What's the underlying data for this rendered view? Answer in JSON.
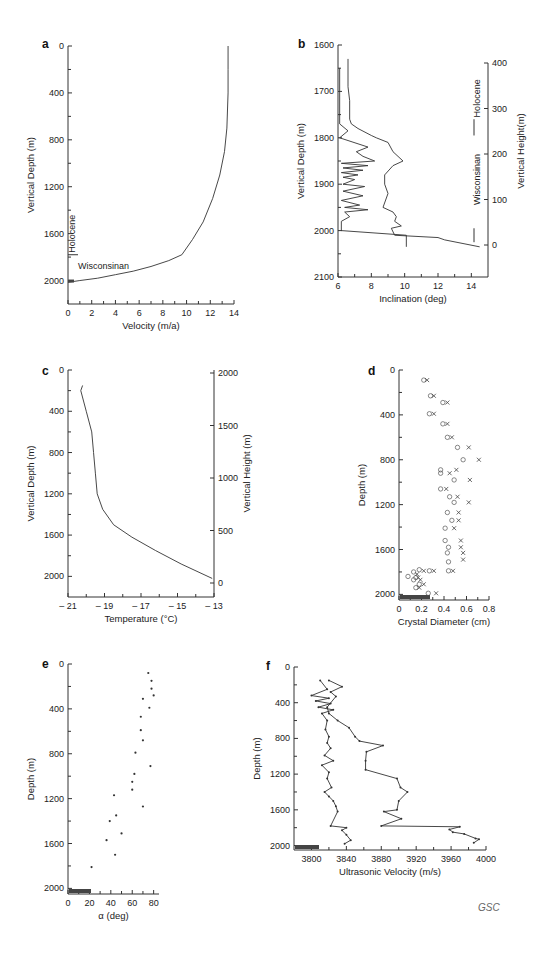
{
  "credit": "GSC",
  "chart_data": [
    {
      "panel": "a",
      "type": "line",
      "xlabel": "Velocity  (m/a)",
      "ylabel": "Vertical Depth (m)",
      "xlim": [
        0,
        14
      ],
      "ylim": [
        0,
        2200
      ],
      "y_inverted": true,
      "xticks": [
        0,
        2,
        4,
        6,
        8,
        10,
        12,
        14
      ],
      "yticks": [
        0,
        400,
        800,
        1200,
        1600,
        2000
      ],
      "annotations": [
        "Holocene",
        "Wisconsinan"
      ],
      "series": [
        {
          "name": "velocity",
          "x": [
            13.5,
            13.5,
            13.5,
            13.4,
            13.2,
            12.8,
            12.2,
            11.4,
            10.5,
            9.6,
            8.5,
            7,
            5.5,
            4,
            2.5,
            1,
            0
          ],
          "y": [
            0,
            200,
            400,
            700,
            900,
            1100,
            1300,
            1500,
            1650,
            1780,
            1830,
            1880,
            1920,
            1950,
            1980,
            2000,
            2015
          ]
        }
      ]
    },
    {
      "panel": "b",
      "type": "line",
      "xlabel": "Inclination (deg)",
      "ylabel": "Vertical Depth (m)",
      "y2label": "Vertical Height(m)",
      "xlim": [
        6,
        15
      ],
      "ylim": [
        1600,
        2100
      ],
      "y_inverted": true,
      "xticks": [
        6,
        8,
        10,
        12,
        14
      ],
      "yticks": [
        1600,
        1700,
        1800,
        1900,
        2000,
        2100
      ],
      "y2ticks": [
        0,
        100,
        200,
        300,
        400
      ],
      "annotations": [
        "Holocene",
        "Wisconsinan"
      ],
      "series": [
        {
          "name": "inclination-1",
          "x": [
            6.6,
            6.6,
            6.7,
            6.7,
            6.8,
            7.2,
            8.0,
            8.3,
            9.0,
            9.3,
            9.6,
            9.9,
            9.3,
            8.8,
            8.8,
            9.0,
            8.7,
            9.3,
            9.5,
            9.4,
            9.8,
            9.2,
            9.4,
            12.0,
            12.4,
            14.5
          ],
          "y": [
            1630,
            1690,
            1720,
            1760,
            1770,
            1780,
            1795,
            1800,
            1810,
            1830,
            1840,
            1850,
            1860,
            1880,
            1900,
            1920,
            1950,
            1960,
            1970,
            1980,
            1990,
            1995,
            2010,
            2015,
            2020,
            2035
          ]
        },
        {
          "name": "inclination-2",
          "x": [
            6.1,
            6.1,
            6.6,
            6.1,
            7.8,
            7.1,
            7.5,
            8.2,
            6.2,
            7.8,
            6.3,
            7.5,
            6.2,
            7.2,
            6.3,
            7.0,
            6.3,
            7.6,
            6.3,
            7.5,
            6.2,
            7.3,
            6.4,
            7.8,
            6.4,
            6.7,
            6.2,
            6.2,
            10.1,
            10.1
          ],
          "y": [
            1650,
            1770,
            1785,
            1800,
            1820,
            1830,
            1840,
            1850,
            1855,
            1860,
            1865,
            1870,
            1875,
            1880,
            1885,
            1890,
            1900,
            1905,
            1915,
            1925,
            1935,
            1945,
            1950,
            1955,
            1960,
            1970,
            1980,
            2000,
            2010,
            2035
          ]
        }
      ]
    },
    {
      "panel": "c",
      "type": "line",
      "xlabel": "Temperature (°C)",
      "ylabel": "Vertical Depth (m)",
      "y2label": "Vertical Height (m)",
      "xlim": [
        -21,
        -13
      ],
      "ylim": [
        0,
        2200
      ],
      "y_inverted": true,
      "xticks": [
        -21,
        -19,
        -17,
        -15,
        -13
      ],
      "xtick_labels": [
        "– 21",
        "– 19",
        "– 17",
        "– 15",
        "– 13"
      ],
      "yticks": [
        0,
        400,
        800,
        1200,
        1600,
        2000
      ],
      "y2ticks": [
        0,
        500,
        1000,
        1500,
        2000
      ],
      "series": [
        {
          "name": "temperature",
          "x": [
            -20.2,
            -20.3,
            -20.0,
            -19.7,
            -19.6,
            -19.5,
            -19.4,
            -19.1,
            -18.5,
            -17.5,
            -16.2,
            -14.8,
            -13.1
          ],
          "y": [
            150,
            200,
            400,
            600,
            800,
            1000,
            1200,
            1350,
            1500,
            1620,
            1750,
            1880,
            2020
          ]
        }
      ]
    },
    {
      "panel": "d",
      "type": "scatter",
      "xlabel": "Crystal Diameter (cm)",
      "ylabel": "Depth (m)",
      "xlim": [
        0,
        0.8
      ],
      "ylim": [
        0,
        2050
      ],
      "y_inverted": true,
      "xticks": [
        0,
        0.2,
        0.4,
        0.6,
        0.8
      ],
      "yticks": [
        0,
        400,
        800,
        1200,
        1600,
        2000
      ],
      "series": [
        {
          "name": "circles",
          "marker": "o",
          "x": [
            0.22,
            0.28,
            0.39,
            0.27,
            0.39,
            0.43,
            0.52,
            0.57,
            0.37,
            0.37,
            0.49,
            0.37,
            0.45,
            0.49,
            0.43,
            0.47,
            0.41,
            0.41,
            0.44,
            0.43,
            0.44,
            0.44,
            0.18,
            0.27,
            0.13,
            0.08,
            0.15,
            0.13,
            0.18,
            0.15,
            0.26
          ],
          "y": [
            90,
            230,
            290,
            390,
            480,
            600,
            690,
            800,
            890,
            920,
            980,
            1060,
            1130,
            1180,
            1270,
            1340,
            1410,
            1520,
            1580,
            1630,
            1710,
            1790,
            1780,
            1790,
            1800,
            1840,
            1850,
            1870,
            1910,
            1940,
            1990
          ]
        },
        {
          "name": "crosses",
          "marker": "x",
          "x": [
            0.25,
            0.31,
            0.43,
            0.31,
            0.43,
            0.47,
            0.62,
            0.71,
            0.45,
            0.51,
            0.63,
            0.42,
            0.52,
            0.62,
            0.53,
            0.53,
            0.49,
            0.55,
            0.55,
            0.57,
            0.57,
            0.48,
            0.22,
            0.31,
            0.16,
            0.17,
            0.19,
            0.22,
            0.18,
            0.33
          ],
          "y": [
            90,
            230,
            290,
            390,
            480,
            600,
            690,
            800,
            920,
            890,
            980,
            1060,
            1130,
            1180,
            1270,
            1340,
            1410,
            1520,
            1580,
            1630,
            1690,
            1790,
            1790,
            1790,
            1820,
            1850,
            1870,
            1910,
            1940,
            1990
          ]
        }
      ]
    },
    {
      "panel": "e",
      "type": "scatter",
      "xlabel": "α (deg)",
      "ylabel": "Depth (m)",
      "xlim": [
        0,
        85
      ],
      "ylim": [
        0,
        2050
      ],
      "y_inverted": true,
      "xticks": [
        0,
        20,
        40,
        60,
        80
      ],
      "yticks": [
        0,
        400,
        800,
        1200,
        1600,
        2000
      ],
      "series": [
        {
          "name": "alpha",
          "x": [
            75,
            78,
            78,
            80,
            70,
            76,
            68,
            68,
            70,
            63,
            77,
            62,
            60,
            60,
            43,
            70,
            45,
            39,
            50,
            36,
            44,
            22
          ],
          "y": [
            80,
            150,
            220,
            280,
            310,
            390,
            470,
            590,
            680,
            790,
            910,
            980,
            1050,
            1120,
            1170,
            1270,
            1350,
            1400,
            1510,
            1570,
            1700,
            1810
          ]
        }
      ]
    },
    {
      "panel": "f",
      "type": "line",
      "xlabel": "Ultrasonic Velocity (m/s)",
      "ylabel": "Depth (m)",
      "xlim": [
        3780,
        4000
      ],
      "ylim": [
        0,
        2050
      ],
      "y_inverted": true,
      "xticks": [
        3800,
        3840,
        3880,
        3920,
        3960,
        4000
      ],
      "yticks": [
        0,
        400,
        800,
        1200,
        1600,
        2000
      ],
      "series": [
        {
          "name": "velocity-1",
          "x": [
            3810,
            3818,
            3800,
            3820,
            3805,
            3822,
            3808,
            3825,
            3812,
            3818,
            3816,
            3820,
            3818,
            3822,
            3815,
            3825,
            3812,
            3820,
            3818,
            3823,
            3815,
            3820,
            3825,
            3828,
            3830,
            3822,
            3840,
            3835,
            3840,
            3845,
            3838
          ],
          "y": [
            150,
            250,
            320,
            350,
            380,
            410,
            450,
            480,
            520,
            600,
            700,
            780,
            850,
            910,
            990,
            1050,
            1100,
            1180,
            1250,
            1350,
            1400,
            1450,
            1500,
            1560,
            1620,
            1780,
            1800,
            1830,
            1880,
            1940,
            1980
          ]
        },
        {
          "name": "velocity-2",
          "x": [
            3820,
            3835,
            3822,
            3828,
            3818,
            3820,
            3830,
            3843,
            3850,
            3855,
            3882,
            3863,
            3862,
            3862,
            3898,
            3902,
            3910,
            3900,
            3898,
            3883,
            3903,
            3880,
            3970,
            3958,
            3962,
            3975,
            3988,
            3992,
            3986
          ],
          "y": [
            150,
            220,
            280,
            330,
            450,
            520,
            600,
            680,
            780,
            830,
            880,
            950,
            1050,
            1150,
            1250,
            1350,
            1400,
            1500,
            1600,
            1620,
            1700,
            1780,
            1790,
            1820,
            1850,
            1870,
            1920,
            1930,
            1970
          ]
        }
      ]
    }
  ]
}
